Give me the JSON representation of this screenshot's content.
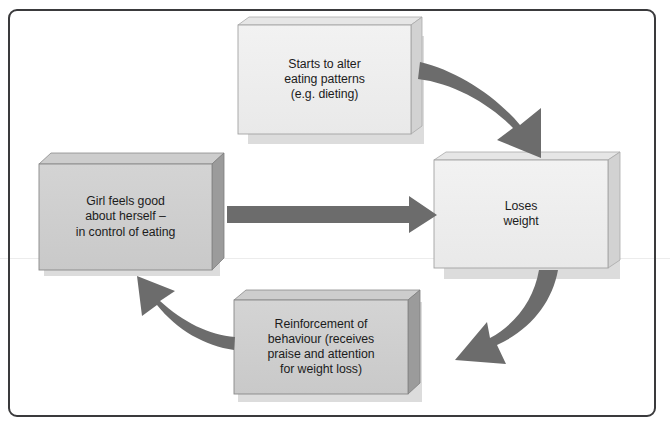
{
  "diagram": {
    "type": "cycle-flowchart",
    "frame": {
      "border_color": "#3a3a3c",
      "background_color": "#ffffff",
      "corner_radius": 9
    },
    "palette": {
      "light_box_face": "#eeeeee",
      "light_box_top": "#e2e2e2",
      "light_box_side": "#d4d4d4",
      "dark_box_face": "#cfcfcf",
      "dark_box_top": "#c6c6c6",
      "dark_box_side": "#9a9a9a",
      "arrow_fill": "#6c6c6c",
      "box_outline": "#8e8e8e",
      "text_color": "#1c1c1c",
      "shadow": "#d9d9d9"
    },
    "nodes": [
      {
        "id": "starts-to-alter",
        "label": "Starts to alter\neating patterns\n(e.g. dieting)",
        "shade": "light",
        "position": "top-center"
      },
      {
        "id": "loses-weight",
        "label": "Loses\nweight",
        "shade": "light",
        "position": "right-middle"
      },
      {
        "id": "reinforcement",
        "label": "Reinforcement of\nbehaviour (receives\npraise and attention\nfor weight loss)",
        "shade": "dark",
        "position": "bottom-center"
      },
      {
        "id": "girl-feels-good",
        "label": "Girl feels good\nabout herself –\nin control of eating",
        "shade": "dark",
        "position": "left-middle"
      }
    ],
    "arrows": [
      {
        "id": "arrow-alter-to-loses",
        "from": "starts-to-alter",
        "to": "loses-weight",
        "style": "curved",
        "direction": "down-right"
      },
      {
        "id": "arrow-loses-to-reinforcement",
        "from": "loses-weight",
        "to": "reinforcement",
        "style": "curved",
        "direction": "down-left"
      },
      {
        "id": "arrow-reinforcement-to-girl",
        "from": "reinforcement",
        "to": "girl-feels-good",
        "style": "curved",
        "direction": "up-left"
      },
      {
        "id": "arrow-girl-to-loses",
        "from": "girl-feels-good",
        "to": "loses-weight",
        "style": "straight",
        "direction": "right"
      }
    ]
  }
}
